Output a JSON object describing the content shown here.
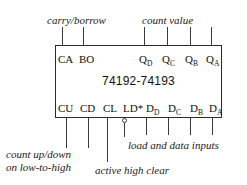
{
  "diagram": {
    "chip_label": "74192-74193",
    "annotations": {
      "carry_borrow": "carry/borrow",
      "count_value": "count value",
      "count_updown_line1": "count up/down",
      "count_updown_line2": "on low-to-high",
      "active_high_clear": "active high clear",
      "load_and_data_inputs": "load and data inputs"
    },
    "top_pins": [
      {
        "name": "CA",
        "sub": ""
      },
      {
        "name": "BO",
        "sub": ""
      },
      {
        "name": "Q",
        "sub": "D"
      },
      {
        "name": "Q",
        "sub": "C"
      },
      {
        "name": "Q",
        "sub": "B"
      },
      {
        "name": "Q",
        "sub": "A"
      }
    ],
    "bottom_pins": [
      {
        "name": "CU",
        "sub": ""
      },
      {
        "name": "CD",
        "sub": ""
      },
      {
        "name": "CL",
        "sub": ""
      },
      {
        "name": "LD*",
        "sub": ""
      },
      {
        "name": "D",
        "sub": "D"
      },
      {
        "name": "D",
        "sub": "C"
      },
      {
        "name": "D",
        "sub": "B"
      },
      {
        "name": "D",
        "sub": "A"
      }
    ],
    "colors": {
      "ink": "#111111",
      "line": "#3a3a3a",
      "box_border": "#2b2b2b",
      "background": "#ffffff"
    }
  }
}
